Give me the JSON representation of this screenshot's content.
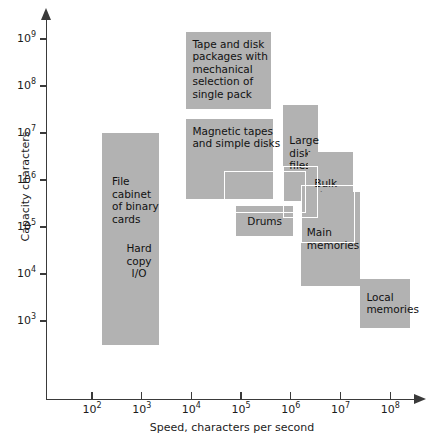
{
  "chart_data": {
    "type": "scatter",
    "title": "",
    "xlabel": "Speed, characters per second",
    "ylabel": "Capacity characters",
    "xlim_log10": [
      1.6,
      8.45
    ],
    "ylim_log10": [
      2.45,
      9.6
    ],
    "grid": false,
    "legend": null,
    "x_ticks": [
      {
        "label_base": "10",
        "label_exp": "2",
        "value_log10": 2
      },
      {
        "label_base": "10",
        "label_exp": "3",
        "value_log10": 3
      },
      {
        "label_base": "10",
        "label_exp": "4",
        "value_log10": 4
      },
      {
        "label_base": "10",
        "label_exp": "5",
        "value_log10": 5
      },
      {
        "label_base": "10",
        "label_exp": "6",
        "value_log10": 6
      },
      {
        "label_base": "10",
        "label_exp": "7",
        "value_log10": 7
      },
      {
        "label_base": "10",
        "label_exp": "8",
        "value_log10": 8
      }
    ],
    "y_ticks": [
      {
        "label_base": "10",
        "label_exp": "9",
        "value_log10": 9
      },
      {
        "label_base": "10",
        "label_exp": "8",
        "value_log10": 8
      },
      {
        "label_base": "10",
        "label_exp": "7",
        "value_log10": 7
      },
      {
        "label_base": "10",
        "label_exp": "6",
        "value_log10": 6
      },
      {
        "label_base": "10",
        "label_exp": "5",
        "value_log10": 5
      },
      {
        "label_base": "10",
        "label_exp": "4",
        "value_log10": 4
      },
      {
        "label_base": "10",
        "label_exp": "3",
        "value_log10": 3
      }
    ],
    "regions": [
      {
        "name": "file-cabinet-of-binary-cards",
        "label": "File\ncabinet\nof binary\ncards",
        "x_range_log10": [
          2.2,
          3.35
        ],
        "y_range_log10": [
          2.5,
          7.0
        ],
        "outlined": false,
        "label_align": "top-left"
      },
      {
        "name": "hard-copy-io",
        "label": "Hard\ncopy\nI/O",
        "x_range_log10": [
          2.2,
          3.35
        ],
        "y_range_log10": [
          2.5,
          7.0
        ],
        "outlined": false,
        "label_align": "mid-left"
      },
      {
        "name": "tape-and-disk-packages",
        "label": "Tape and disk\npackages with\nmechanical\nselection of\nsingle pack",
        "x_range_log10": [
          3.9,
          5.6
        ],
        "y_range_log10": [
          7.5,
          9.15
        ],
        "outlined": false,
        "label_align": "top-left"
      },
      {
        "name": "magnetic-tapes-and-simple-disks",
        "label": "Magnetic tapes\nand simple disks",
        "x_range_log10": [
          3.9,
          5.65
        ],
        "y_range_log10": [
          5.6,
          7.3
        ],
        "outlined": false,
        "label_align": "top-left"
      },
      {
        "name": "large-disk-files",
        "label": "Large\ndisk\nfiles",
        "x_range_log10": [
          5.85,
          6.55
        ],
        "y_range_log10": [
          5.55,
          7.6
        ],
        "outlined": false,
        "label_align": "mid-left"
      },
      {
        "name": "bulk-stores",
        "label": "Bulk\nstores",
        "x_range_log10": [
          6.35,
          7.25
        ],
        "y_range_log10": [
          5.0,
          6.6
        ],
        "outlined": false,
        "label_align": "mid-left"
      },
      {
        "name": "drums",
        "label": "Drums",
        "x_range_log10": [
          4.9,
          6.05
        ],
        "y_range_log10": [
          4.8,
          5.45
        ],
        "outlined": false,
        "label_align": "center"
      },
      {
        "name": "main-memories",
        "label": "Main\nmemories",
        "x_range_log10": [
          6.2,
          7.4
        ],
        "y_range_log10": [
          3.75,
          5.75
        ],
        "outlined": false,
        "label_align": "mid-left"
      },
      {
        "name": "local-memories",
        "label": "Local\nmemories",
        "x_range_log10": [
          7.4,
          8.4
        ],
        "y_range_log10": [
          2.85,
          3.9
        ],
        "outlined": false,
        "label_align": "mid-left"
      }
    ],
    "overlay_outlines": [
      {
        "name": "outline-drums-upper",
        "x_range_log10": [
          4.65,
          6.3
        ],
        "y_range_log10": [
          5.3,
          6.2
        ]
      },
      {
        "name": "outline-large-disk-lower",
        "x_range_log10": [
          5.85,
          6.55
        ],
        "y_range_log10": [
          5.2,
          6.3
        ]
      },
      {
        "name": "outline-bulk-stores-lower",
        "x_range_log10": [
          6.2,
          7.3
        ],
        "y_range_log10": [
          4.65,
          5.9
        ]
      }
    ]
  }
}
